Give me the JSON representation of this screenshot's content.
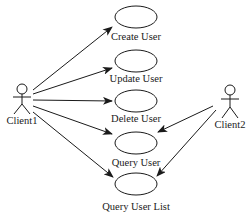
{
  "diagram": {
    "type": "use-case",
    "actors": [
      {
        "id": "client1",
        "label": "Client1",
        "x": 22,
        "y": 90,
        "label_x": 22,
        "label_y": 124
      },
      {
        "id": "client2",
        "label": "Client2",
        "x": 230,
        "y": 90,
        "label_x": 230,
        "label_y": 128
      }
    ],
    "use_cases": [
      {
        "id": "create_user",
        "label": "Create User",
        "cx": 136,
        "cy": 17,
        "label_y": 40
      },
      {
        "id": "update_user",
        "label": "Update User",
        "cx": 136,
        "cy": 61,
        "label_y": 82
      },
      {
        "id": "delete_user",
        "label": "Delete User",
        "cx": 136,
        "cy": 101,
        "label_y": 122
      },
      {
        "id": "query_user",
        "label": "Query User",
        "cx": 136,
        "cy": 143,
        "label_y": 166
      },
      {
        "id": "query_user_list",
        "label": "Query User List",
        "cx": 136,
        "cy": 184,
        "label_y": 210
      }
    ],
    "associations": [
      {
        "from": "client1",
        "to": "create_user"
      },
      {
        "from": "client1",
        "to": "update_user"
      },
      {
        "from": "client1",
        "to": "delete_user"
      },
      {
        "from": "client1",
        "to": "query_user"
      },
      {
        "from": "client1",
        "to": "query_user_list"
      },
      {
        "from": "client2",
        "to": "query_user"
      },
      {
        "from": "client2",
        "to": "query_user_list"
      }
    ],
    "colors": {
      "stroke": "#1a1a1a",
      "background": "#ffffff"
    }
  }
}
